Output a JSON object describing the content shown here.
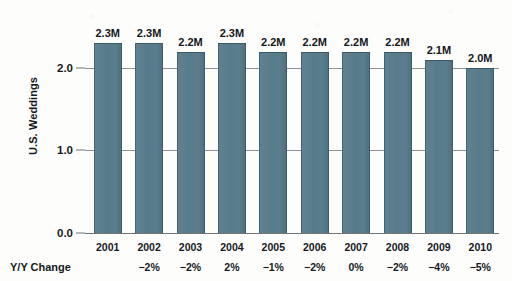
{
  "chart_data": {
    "type": "bar",
    "title": "",
    "subtitle": "",
    "xlabel": "",
    "ylabel": "U.S. Weddings",
    "categories": [
      "2001",
      "2002",
      "2003",
      "2004",
      "2005",
      "2006",
      "2007",
      "2008",
      "2009",
      "2010"
    ],
    "values": [
      2.3,
      2.3,
      2.2,
      2.3,
      2.2,
      2.2,
      2.2,
      2.2,
      2.1,
      2.0
    ],
    "data_labels": [
      "2.3M",
      "2.3M",
      "2.2M",
      "2.3M",
      "2.2M",
      "2.2M",
      "2.2M",
      "2.2M",
      "2.1M",
      "2.0M"
    ],
    "ylim": [
      0.0,
      2.5
    ],
    "yticks": [
      0.0,
      1.0,
      2.0
    ],
    "ytick_labels": [
      "0.0",
      "1.0",
      "2.0"
    ],
    "grid": true,
    "legend": null,
    "bar_color": "#5a7d8c",
    "bar_edge_color": "#3e5c68",
    "gridline_color": "#8d9399",
    "text_color": "#15191c",
    "annotation_row": {
      "label": "Y/Y Change",
      "values": [
        "",
        "−2%",
        "−2%",
        "2%",
        "−1%",
        "−2%",
        "0%",
        "−2%",
        "−4%",
        "−5%"
      ]
    }
  }
}
